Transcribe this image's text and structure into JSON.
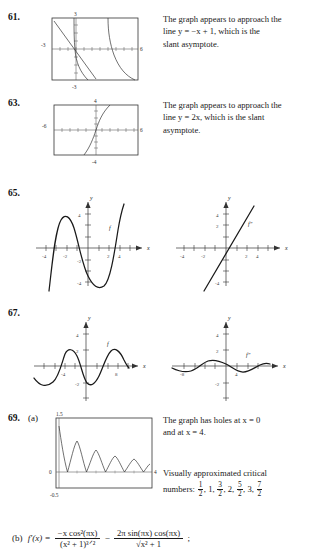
{
  "page": {
    "width": 316,
    "height": 559
  },
  "problems": [
    {
      "number": "61.",
      "answer_lines": [
        "The graph appears to approach the",
        "line y = −x + 1, which is the",
        "slant asymptote."
      ],
      "graph": {
        "type": "calculator-window",
        "xlabels": [
          "-3",
          "6"
        ],
        "ylabels": [
          "3",
          "-3"
        ],
        "description": "rational function with slant asymptote y = -x + 1"
      }
    },
    {
      "number": "63.",
      "answer_lines": [
        "The graph appears to approach the",
        "line y = 2x, which is the slant",
        "asymptote."
      ],
      "graph": {
        "type": "calculator-window",
        "xlabels": [
          "-6",
          "6"
        ],
        "ylabels": [
          "4",
          "-4"
        ],
        "description": "rational function with slant asymptote y = 2x"
      }
    },
    {
      "number": "65.",
      "answer_lines": [],
      "graph_left": {
        "type": "cartesian",
        "axis_x_label": "x",
        "axis_y_label": "y",
        "xticks": [
          "-4",
          "-2",
          "2",
          "4"
        ],
        "yticks": [
          "4",
          "2",
          "-2",
          "-4"
        ],
        "curve_label": "f",
        "description": "quartic-like curve with local max near x = -2 and local min near x = 2"
      },
      "graph_right": {
        "type": "cartesian",
        "axis_x_label": "x",
        "axis_y_label": "y",
        "xticks": [
          "-4",
          "-2",
          "2",
          "4"
        ],
        "yticks": [
          "4",
          "2",
          "-2",
          "-4"
        ],
        "curve_label": "f″",
        "description": "increasing straight line through origin"
      }
    },
    {
      "number": "67.",
      "answer_lines": [],
      "graph_left": {
        "type": "cartesian",
        "axis_x_label": "x",
        "axis_y_label": "y",
        "xticks": [
          "-4",
          "8"
        ],
        "yticks": [
          "4",
          "2",
          "-2"
        ],
        "curve_label": "f",
        "description": "sine-like wave of amplitude 2"
      },
      "graph_right": {
        "type": "cartesian",
        "axis_x_label": "x",
        "axis_y_label": "y",
        "xticks": [
          "-8",
          "4"
        ],
        "yticks": [
          "4",
          "2",
          "-2"
        ],
        "curve_label": "f″",
        "description": "small amplitude sine-like wave"
      }
    },
    {
      "number": "69.",
      "part_a_label": "(a)",
      "part_b_label": "(b)",
      "answer_lines": [
        "The graph has holes at x = 0",
        "and at x = 4."
      ],
      "critical_intro": "Visually approximated critical",
      "critical_label": "numbers:",
      "critical_numbers": [
        {
          "num": "1",
          "den": "2"
        },
        {
          "whole": "1"
        },
        {
          "num": "3",
          "den": "2"
        },
        {
          "whole": "2"
        },
        {
          "num": "5",
          "den": "2"
        },
        {
          "whole": "3"
        },
        {
          "num": "7",
          "den": "2"
        }
      ],
      "graph": {
        "type": "calculator-window",
        "xlabels": [
          "0",
          "4"
        ],
        "ylabels": [
          "1.5",
          "-0.5"
        ],
        "description": "damped oscillation |cos(pi x)| / sqrt(x^2+1) style decaying humps"
      },
      "derivative": {
        "lhs": "f′(x)  =",
        "term1_num": "−x cos²(πx)",
        "term1_den": "(x² + 1)³ᐟ²",
        "minus": "−",
        "term2_num": "2π sin(πx) cos(πx)",
        "term2_den": "√x² + 1",
        "trailing": ";"
      }
    }
  ]
}
